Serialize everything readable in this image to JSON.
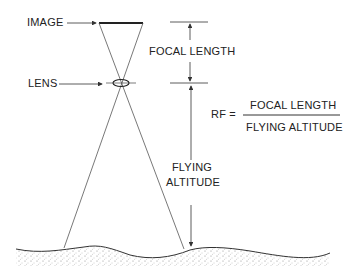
{
  "diagram": {
    "labels": {
      "image": "IMAGE",
      "lens": "LENS",
      "focal_length": "FOCAL LENGTH",
      "flying_altitude_line1": "FLYING",
      "flying_altitude_line2": "ALTITUDE"
    },
    "formula": {
      "lhs": "RF =",
      "numerator": "FOCAL LENGTH",
      "denominator": "FLYING ALTITUDE"
    },
    "colors": {
      "line": "#333333",
      "ground_stipple": "#888888"
    }
  }
}
